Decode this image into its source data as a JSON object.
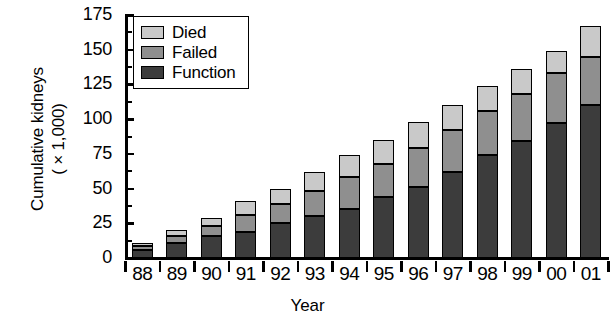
{
  "chart_data": {
    "type": "bar",
    "stacked": true,
    "title": "",
    "xlabel": "Year",
    "ylabel": "Cumulative kidneys ( × 1,000)",
    "ylabel_line1": "Cumulative kidneys",
    "ylabel_line2": "( × 1,000)",
    "categories": [
      "88",
      "89",
      "90",
      "91",
      "92",
      "93",
      "94",
      "95",
      "96",
      "97",
      "98",
      "99",
      "00",
      "01"
    ],
    "ylim": [
      0,
      175
    ],
    "yticks": [
      0,
      25,
      50,
      75,
      100,
      125,
      150,
      175
    ],
    "ytick_labels": [
      "0",
      "25",
      "50",
      "75",
      "100",
      "125",
      "150",
      "175"
    ],
    "yminor_ticks": [
      12.5,
      37.5,
      62.5,
      87.5,
      112.5,
      137.5,
      162.5
    ],
    "grid": false,
    "legend_position": "top-left",
    "stack_order_bottom_to_top": [
      "Function",
      "Failed",
      "Died"
    ],
    "series": [
      {
        "name": "Function",
        "color": "#3c3c3c",
        "values": [
          6,
          11,
          16,
          19,
          25,
          30,
          35,
          44,
          51,
          62,
          74,
          84,
          97,
          110
        ]
      },
      {
        "name": "Failed",
        "color": "#8f8f8f",
        "values": [
          3,
          5,
          7,
          12,
          14,
          18,
          23,
          24,
          28,
          30,
          32,
          34,
          36,
          35
        ]
      },
      {
        "name": "Died",
        "color": "#c9c9c9",
        "values": [
          2,
          4,
          6,
          10,
          11,
          14,
          16,
          17,
          19,
          18,
          18,
          18,
          16,
          22
        ]
      }
    ],
    "totals": [
      11,
      20,
      29,
      41,
      50,
      62,
      74,
      85,
      98,
      110,
      124,
      136,
      149,
      167
    ]
  },
  "legend": {
    "items": [
      {
        "label": "Died",
        "color": "#c9c9c9"
      },
      {
        "label": "Failed",
        "color": "#8f8f8f"
      },
      {
        "label": "Function",
        "color": "#3c3c3c"
      }
    ]
  }
}
